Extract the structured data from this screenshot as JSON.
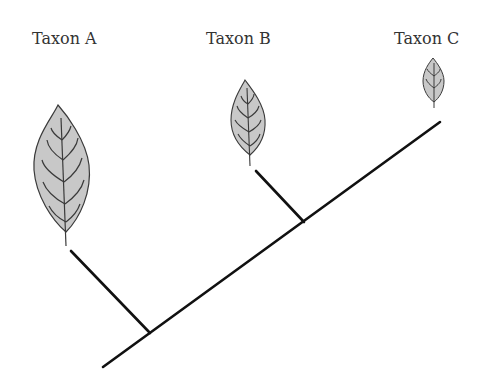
{
  "diagram": {
    "type": "cladogram",
    "taxa": [
      {
        "label": "Taxon A",
        "x": 32,
        "y": 32,
        "leaf_size": "large"
      },
      {
        "label": "Taxon B",
        "x": 206,
        "y": 32,
        "leaf_size": "medium"
      },
      {
        "label": "Taxon C",
        "x": 394,
        "y": 32,
        "leaf_size": "small"
      }
    ],
    "colors": {
      "leaf_fill": "#c8c8c8",
      "leaf_stroke": "#3a3a3a",
      "branch": "#111111",
      "text": "#333333"
    }
  }
}
